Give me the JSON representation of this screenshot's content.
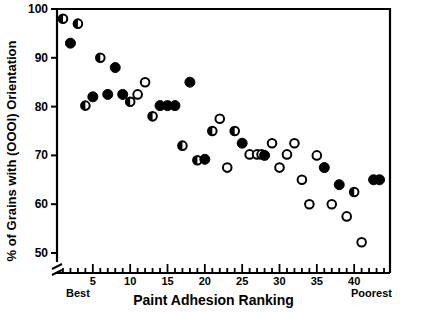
{
  "chart_data": {
    "type": "scatter",
    "title": "",
    "xlabel": "Paint  Adhesion  Ranking",
    "ylabel": "% of Grains with (OOOl) Orientation",
    "xlim": [
      0.2,
      44.8
    ],
    "ylim": [
      48.0,
      100.0
    ],
    "grid": false,
    "legend_position": "none",
    "y_axis_break": true,
    "y_axis_break_note": "axis broken below 50",
    "xticks_labeled": [
      5,
      10,
      15,
      20,
      25,
      30,
      35,
      40
    ],
    "xtick_labels": [
      "5",
      "10",
      "15",
      "20",
      "25",
      "30",
      "35",
      "40"
    ],
    "xticks_minor_every": 1,
    "xtick_range": [
      1,
      44
    ],
    "yticks": [
      50,
      60,
      70,
      80,
      90,
      100
    ],
    "ytick_labels": [
      "50",
      "60",
      "70",
      "80",
      "90",
      "100"
    ],
    "x_end_labels": {
      "left": "Best",
      "right": "Poorest"
    },
    "marker_styles": {
      "filled": "solid black circle",
      "open": "open circle with black outline",
      "half": "circle with left half black, right half white"
    },
    "series": [
      {
        "name": "All samples",
        "points": [
          {
            "x": 1,
            "y": 98.0,
            "marker": "half"
          },
          {
            "x": 2,
            "y": 93.0,
            "marker": "filled"
          },
          {
            "x": 3,
            "y": 97.0,
            "marker": "half"
          },
          {
            "x": 4,
            "y": 80.2,
            "marker": "half"
          },
          {
            "x": 5,
            "y": 82.0,
            "marker": "filled"
          },
          {
            "x": 6,
            "y": 90.0,
            "marker": "half"
          },
          {
            "x": 7,
            "y": 82.5,
            "marker": "filled"
          },
          {
            "x": 8,
            "y": 88.0,
            "marker": "filled"
          },
          {
            "x": 9,
            "y": 82.5,
            "marker": "filled"
          },
          {
            "x": 10,
            "y": 81.0,
            "marker": "half"
          },
          {
            "x": 11,
            "y": 82.5,
            "marker": "open"
          },
          {
            "x": 12,
            "y": 85.0,
            "marker": "open"
          },
          {
            "x": 13,
            "y": 78.0,
            "marker": "half"
          },
          {
            "x": 14,
            "y": 80.2,
            "marker": "filled"
          },
          {
            "x": 15,
            "y": 80.2,
            "marker": "filled"
          },
          {
            "x": 16,
            "y": 80.2,
            "marker": "filled"
          },
          {
            "x": 17,
            "y": 72.0,
            "marker": "half"
          },
          {
            "x": 18,
            "y": 85.0,
            "marker": "filled"
          },
          {
            "x": 19,
            "y": 69.0,
            "marker": "half"
          },
          {
            "x": 20,
            "y": 69.2,
            "marker": "filled"
          },
          {
            "x": 21,
            "y": 75.0,
            "marker": "half"
          },
          {
            "x": 22,
            "y": 77.5,
            "marker": "open"
          },
          {
            "x": 23,
            "y": 67.5,
            "marker": "open"
          },
          {
            "x": 24,
            "y": 75.0,
            "marker": "half"
          },
          {
            "x": 25,
            "y": 72.5,
            "marker": "filled"
          },
          {
            "x": 26,
            "y": 70.2,
            "marker": "open"
          },
          {
            "x": 27,
            "y": 70.2,
            "marker": "open"
          },
          {
            "x": 27.6,
            "y": 70.2,
            "marker": "open"
          },
          {
            "x": 28,
            "y": 70.0,
            "marker": "filled"
          },
          {
            "x": 29,
            "y": 72.5,
            "marker": "open"
          },
          {
            "x": 30,
            "y": 67.5,
            "marker": "open"
          },
          {
            "x": 31,
            "y": 70.2,
            "marker": "open"
          },
          {
            "x": 32,
            "y": 72.5,
            "marker": "open"
          },
          {
            "x": 33,
            "y": 65.0,
            "marker": "open"
          },
          {
            "x": 34,
            "y": 60.0,
            "marker": "open"
          },
          {
            "x": 35,
            "y": 70.0,
            "marker": "open"
          },
          {
            "x": 36,
            "y": 67.5,
            "marker": "filled"
          },
          {
            "x": 37,
            "y": 60.0,
            "marker": "open"
          },
          {
            "x": 38,
            "y": 64.0,
            "marker": "filled"
          },
          {
            "x": 39,
            "y": 57.5,
            "marker": "open"
          },
          {
            "x": 40,
            "y": 62.5,
            "marker": "half"
          },
          {
            "x": 41,
            "y": 52.2,
            "marker": "open"
          },
          {
            "x": 42.6,
            "y": 65.0,
            "marker": "filled"
          },
          {
            "x": 43.4,
            "y": 65.0,
            "marker": "filled"
          }
        ]
      }
    ]
  },
  "colors": {
    "ink": "#000000",
    "paper": "#ffffff"
  }
}
